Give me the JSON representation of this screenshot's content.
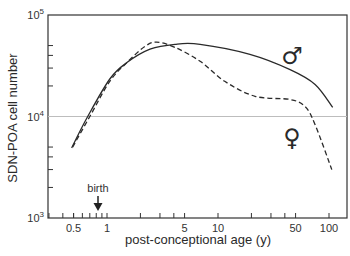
{
  "chart_data": {
    "type": "line",
    "title": "",
    "xlabel": "post-conceptional age (y)",
    "ylabel": "SDN-POA cell number",
    "xscale": "log",
    "yscale": "log",
    "xlim": [
      0.29,
      145
    ],
    "ylim": [
      1000,
      100000
    ],
    "x_ticks": [
      0.5,
      1,
      5,
      10,
      50,
      100
    ],
    "x_tick_labels": [
      "0.5",
      "1",
      "5",
      "10",
      "50",
      "100"
    ],
    "y_ticks": [
      1000,
      10000,
      100000
    ],
    "y_tick_labels": [
      {
        "base": "10",
        "exp": "3"
      },
      {
        "base": "10",
        "exp": "4"
      },
      {
        "base": "10",
        "exp": "5"
      }
    ],
    "grid": false,
    "reference_line": {
      "y": 10000,
      "color": "#bdbdbd"
    },
    "annotations": [
      {
        "text": "birth",
        "x": 0.85,
        "arrow": "down"
      }
    ],
    "series": [
      {
        "name": "male",
        "symbol": "♂",
        "style": "solid",
        "x": [
          0.48,
          0.67,
          1.06,
          1.51,
          2.44,
          4.1,
          6.9,
          19.4,
          44.6,
          75,
          108
        ],
        "values": [
          4900,
          10000,
          23400,
          34000,
          46000,
          51500,
          51500,
          41000,
          29000,
          20700,
          12300
        ]
      },
      {
        "name": "female",
        "symbol": "♀",
        "style": "dashed",
        "x": [
          0.49,
          0.7,
          1.06,
          1.51,
          2.2,
          2.8,
          4.1,
          6.9,
          11.5,
          21.6,
          44.6,
          61,
          75,
          106
        ],
        "values": [
          5000,
          10000,
          22200,
          34000,
          49000,
          54000,
          48000,
          35000,
          22200,
          15800,
          14700,
          12500,
          8300,
          3000
        ]
      }
    ],
    "legend": {
      "position": "inline",
      "entries": [
        "♂",
        "♀"
      ]
    }
  },
  "labels": {
    "xlabel": "post-conceptional age (y)",
    "ylabel": "SDN-POA cell number",
    "birth": "birth",
    "male_symbol": "♂",
    "female_symbol": "♀"
  },
  "colors": {
    "line": "#2a2a2a",
    "axis": "#333333",
    "reference": "#bdbdbd"
  }
}
